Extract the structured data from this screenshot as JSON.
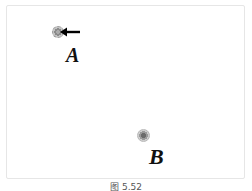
{
  "figure": {
    "caption": "图 5.52",
    "points": [
      {
        "id": "A",
        "label": "A",
        "has_arrow": true,
        "arrow_direction": "left"
      },
      {
        "id": "B",
        "label": "B",
        "has_arrow": false
      }
    ],
    "colors": {
      "frame_border": "#e6e6e6",
      "point_fill": "#8a8a8a",
      "label": "#111111",
      "arrow": "#000000"
    }
  }
}
